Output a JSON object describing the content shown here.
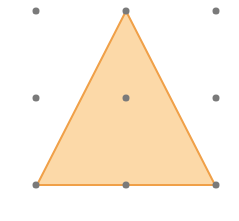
{
  "diagram": {
    "type": "dot-grid-shape",
    "grid": {
      "rows": 3,
      "cols": 3,
      "xs": [
        36,
        126,
        216
      ],
      "ys": [
        11,
        98,
        185
      ],
      "dot_radius": 3.5,
      "dot_color": "#7a7a7a"
    },
    "shape": {
      "kind": "triangle",
      "vertices": [
        [
          126,
          11
        ],
        [
          37,
          185
        ],
        [
          215,
          185
        ]
      ],
      "fill": "#fcd9a8",
      "stroke": "#f0a048",
      "stroke_width": 2
    }
  }
}
